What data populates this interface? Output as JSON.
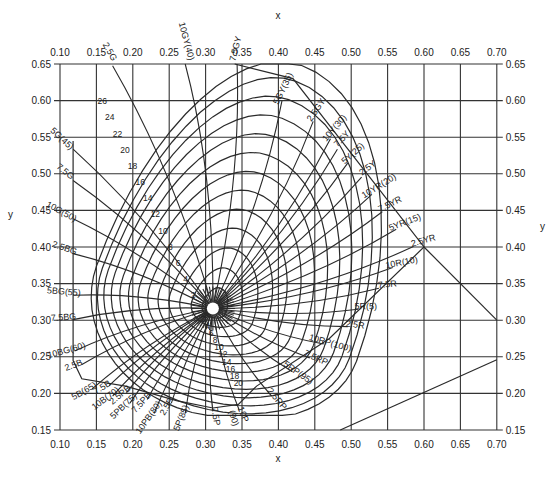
{
  "chart_data": {
    "type": "line",
    "title": "",
    "xlabel": "x",
    "ylabel": "y",
    "xlim": [
      0.1,
      0.7
    ],
    "ylim": [
      0.15,
      0.65
    ],
    "grid": true,
    "x_ticks": [
      "0.10",
      "0.15",
      "0.20",
      "0.25",
      "0.30",
      "0.35",
      "0.40",
      "0.45",
      "0.50",
      "0.55",
      "0.60",
      "0.65",
      "0.70"
    ],
    "y_ticks": [
      "0.65",
      "0.60",
      "0.55",
      "0.50",
      "0.45",
      "0.40",
      "0.35",
      "0.30",
      "0.25",
      "0.20",
      "0.15"
    ],
    "white_point": {
      "x": 0.31,
      "y": 0.316
    },
    "hue_labels": [
      {
        "label": "2.5G",
        "x": 0.165,
        "y": 0.665
      },
      {
        "label": "10GY(40)",
        "x": 0.27,
        "y": 0.68
      },
      {
        "label": "7.5GY",
        "x": 0.345,
        "y": 0.67
      },
      {
        "label": "5GY(35)",
        "x": 0.41,
        "y": 0.615
      },
      {
        "label": "2.5GY",
        "x": 0.455,
        "y": 0.585
      },
      {
        "label": "10Y(30)",
        "x": 0.48,
        "y": 0.56
      },
      {
        "label": "7.5Y",
        "x": 0.49,
        "y": 0.545
      },
      {
        "label": "5Y(25)",
        "x": 0.505,
        "y": 0.525
      },
      {
        "label": "2.5Y",
        "x": 0.525,
        "y": 0.505
      },
      {
        "label": "10YR(20)",
        "x": 0.54,
        "y": 0.48
      },
      {
        "label": "7.5YR",
        "x": 0.555,
        "y": 0.455
      },
      {
        "label": "5YR(15)",
        "x": 0.575,
        "y": 0.43
      },
      {
        "label": "2.5YR",
        "x": 0.6,
        "y": 0.405
      },
      {
        "label": "10R(10)",
        "x": 0.57,
        "y": 0.375
      },
      {
        "label": "7.5R",
        "x": 0.55,
        "y": 0.345
      },
      {
        "label": "5R(5)",
        "x": 0.52,
        "y": 0.315
      },
      {
        "label": "2.5R",
        "x": 0.505,
        "y": 0.29
      },
      {
        "label": "10RP(100)",
        "x": 0.47,
        "y": 0.265
      },
      {
        "label": "7.5RP",
        "x": 0.45,
        "y": 0.245
      },
      {
        "label": "5RP(95)",
        "x": 0.425,
        "y": 0.225
      },
      {
        "label": "2.5RP",
        "x": 0.395,
        "y": 0.19
      },
      {
        "label": "10P",
        "x": 0.348,
        "y": 0.17
      },
      {
        "label": "(90)",
        "x": 0.335,
        "y": 0.165
      },
      {
        "label": "7.5P",
        "x": 0.31,
        "y": 0.168
      },
      {
        "label": "5P(85)",
        "x": 0.27,
        "y": 0.165
      },
      {
        "label": "2.5P",
        "x": 0.25,
        "y": 0.18
      },
      {
        "label": "10PB(80)",
        "x": 0.225,
        "y": 0.165
      },
      {
        "label": "7.5PB",
        "x": 0.215,
        "y": 0.185
      },
      {
        "label": "5PB(75)",
        "x": 0.19,
        "y": 0.18
      },
      {
        "label": "2.5PB",
        "x": 0.185,
        "y": 0.195
      },
      {
        "label": "10B(70)",
        "x": 0.165,
        "y": 0.19
      },
      {
        "label": "7.5B",
        "x": 0.16,
        "y": 0.205
      },
      {
        "label": "5B(65)",
        "x": 0.135,
        "y": 0.2
      },
      {
        "label": "2.5B",
        "x": 0.12,
        "y": 0.235
      },
      {
        "label": "10BG(60)",
        "x": 0.11,
        "y": 0.255
      },
      {
        "label": "7.5BG",
        "x": 0.105,
        "y": 0.3
      },
      {
        "label": "5BG(55)",
        "x": 0.105,
        "y": 0.335
      },
      {
        "label": "2.5BG",
        "x": 0.105,
        "y": 0.395
      },
      {
        "label": "10G(50)",
        "x": 0.1,
        "y": 0.445
      },
      {
        "label": "7.5G",
        "x": 0.105,
        "y": 0.5
      },
      {
        "label": "5G(45)",
        "x": 0.1,
        "y": 0.545
      }
    ],
    "chroma_labels_upper": [
      "26",
      "24",
      "22",
      "20",
      "18",
      "16",
      "14",
      "12",
      "10",
      "8",
      "6",
      "4",
      "2"
    ],
    "chroma_labels_lower": [
      "2",
      "4",
      "6",
      "8",
      "10",
      "12",
      "14",
      "16",
      "18",
      "20"
    ],
    "chroma_loci": [
      {
        "chroma": 2,
        "rx": 0.018,
        "ry": 0.022
      },
      {
        "chroma": 4,
        "rx": 0.036,
        "ry": 0.043
      },
      {
        "chroma": 6,
        "rx": 0.055,
        "ry": 0.064
      },
      {
        "chroma": 8,
        "rx": 0.073,
        "ry": 0.085
      },
      {
        "chroma": 10,
        "rx": 0.091,
        "ry": 0.105
      },
      {
        "chroma": 12,
        "rx": 0.108,
        "ry": 0.125
      },
      {
        "chroma": 14,
        "rx": 0.124,
        "ry": 0.145
      },
      {
        "chroma": 16,
        "rx": 0.14,
        "ry": 0.165
      },
      {
        "chroma": 18,
        "rx": 0.154,
        "ry": 0.185
      },
      {
        "chroma": 20,
        "rx": 0.168,
        "ry": 0.205
      },
      {
        "chroma": 22,
        "rx": 0.18,
        "ry": 0.225
      },
      {
        "chroma": 24,
        "rx": 0.19,
        "ry": 0.245
      },
      {
        "chroma": 26,
        "rx": 0.2,
        "ry": 0.262
      }
    ],
    "boundary_lines": [
      {
        "from": [
          0.6,
          0.4
        ],
        "to": [
          0.7,
          0.3
        ]
      },
      {
        "from": [
          0.485,
          0.15
        ],
        "to": [
          0.7,
          0.246
        ]
      }
    ]
  },
  "axes": {
    "x_label_top": "x",
    "x_label_bottom": "x",
    "y_label_left": "y",
    "y_label_right": "y"
  }
}
